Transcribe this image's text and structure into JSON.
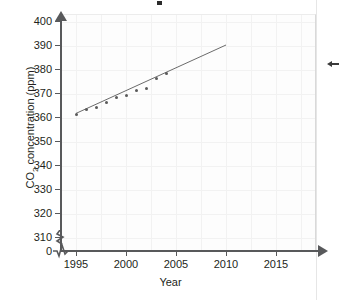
{
  "chart_data": {
    "type": "scatter",
    "title": "",
    "xlabel": "Year",
    "ylabel": "CO2 concentration (ppm)",
    "ylabel_rich": {
      "prefix": "CO",
      "sub": "2",
      "suffix": " concentration (ppm)"
    },
    "x": [
      1995,
      1996,
      1997,
      1998,
      1999,
      2000,
      2001,
      2002,
      2003,
      2004
    ],
    "values": [
      361,
      363,
      364,
      366,
      368,
      369,
      371,
      372,
      376,
      378
    ],
    "series": [
      {
        "name": "CO2 concentration",
        "points": [
          {
            "x": 1995,
            "y": 361
          },
          {
            "x": 1996,
            "y": 363
          },
          {
            "x": 1997,
            "y": 364
          },
          {
            "x": 1998,
            "y": 366
          },
          {
            "x": 1999,
            "y": 368
          },
          {
            "x": 2000,
            "y": 369
          },
          {
            "x": 2001,
            "y": 371
          },
          {
            "x": 2002,
            "y": 372
          },
          {
            "x": 2003,
            "y": 376
          },
          {
            "x": 2004,
            "y": 378
          }
        ]
      }
    ],
    "trend_line": {
      "x_start": 1995,
      "y_start": 361.5,
      "x_end": 2010,
      "y_end": 390
    },
    "xlim": [
      1993,
      2016
    ],
    "ylim": [
      310,
      402
    ],
    "xticks": [
      1995,
      2000,
      2005,
      2010,
      2015
    ],
    "yticks": [
      310,
      320,
      330,
      340,
      350,
      360,
      370,
      380,
      390,
      400
    ],
    "y_zero_label": "0",
    "axis_break_y": true,
    "axis_break_x": true,
    "grid": true,
    "legend": "none",
    "point_color": "#5a5a5a",
    "line_color": "#6b6b6b",
    "axis_color": "#58595b",
    "grid_color": "#f2f2f2"
  },
  "axes": {
    "y_tick_labels": [
      "400",
      "390",
      "380",
      "370",
      "360",
      "350",
      "340",
      "330",
      "320",
      "310"
    ],
    "zero_label": "0",
    "x_tick_labels": [
      "1995",
      "2000",
      "2005",
      "2010",
      "2015"
    ],
    "x_title": "Year"
  },
  "annotations": {
    "right_arrow_marker": "left-arrow-icon"
  }
}
